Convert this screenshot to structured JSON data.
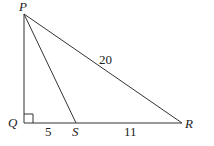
{
  "diagram": {
    "type": "right-triangle",
    "points": {
      "P": {
        "label": "P",
        "x": 24,
        "y": 14
      },
      "Q": {
        "label": "Q",
        "x": 24,
        "y": 123
      },
      "S": {
        "label": "S",
        "x": 76,
        "y": 123
      },
      "R": {
        "label": "R",
        "x": 182,
        "y": 123
      }
    },
    "segments": [
      {
        "from": "P",
        "to": "Q"
      },
      {
        "from": "Q",
        "to": "R"
      },
      {
        "from": "P",
        "to": "R",
        "length_label": "20"
      },
      {
        "from": "P",
        "to": "S"
      }
    ],
    "length_labels": {
      "PR": "20",
      "QS": "5",
      "SR": "11"
    },
    "right_angle_at": "Q",
    "line_color": "#333333"
  }
}
